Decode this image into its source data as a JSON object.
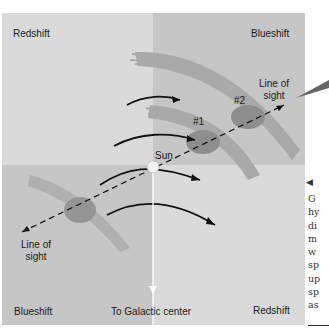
{
  "figure": {
    "quadrant_labels": {
      "top_left": "Redshift",
      "top_right": "Blueshift",
      "bottom_left": "Blueshift",
      "bottom_right": "Redshift"
    },
    "line_of_sight_upper": [
      "Line of",
      "sight"
    ],
    "line_of_sight_lower": [
      "Line of",
      "sight"
    ],
    "sun_label": "Sun",
    "cloud_labels": [
      "#1",
      "#2"
    ],
    "galactic_center_label": "To Galactic center",
    "colors": {
      "light_quadrant": "#d9d9d9",
      "dark_quadrant": "#c4c4c4",
      "arm": "#a8a8a8",
      "cloud": "#8f8f8f",
      "arrow": "#111111",
      "sun": "#f2f2f2"
    }
  },
  "caption": {
    "arrow": "◀",
    "lines": [
      "G",
      "hy",
      "di",
      "m",
      "w",
      "sp",
      "up",
      "sp",
      "as"
    ]
  }
}
